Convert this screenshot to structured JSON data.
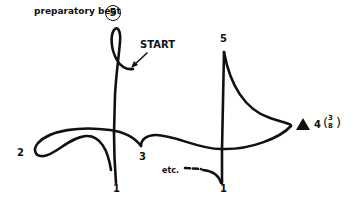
{
  "diagram": {
    "title_label": "preparatory beat",
    "preparatory_beat_number": "5",
    "start_label": "START",
    "beats": [
      {
        "label": "1",
        "position": "downbeat-first"
      },
      {
        "label": "2",
        "position": "left"
      },
      {
        "label": "3",
        "position": "center-right"
      },
      {
        "label": "4",
        "position": "right",
        "suffix": "(3/8)"
      },
      {
        "label": "5",
        "position": "top-right"
      },
      {
        "label": "1",
        "position": "downbeat-repeat"
      }
    ],
    "beat_labels": {
      "one_a": "1",
      "two": "2",
      "three": "3",
      "four": "4",
      "four_frac_num": "3",
      "four_frac_den": "8",
      "five": "5",
      "one_b": "1"
    },
    "continuation_label": "etc.",
    "marker": "filled-triangle",
    "colors": {
      "ink": "#111111",
      "background": "#ffffff"
    }
  }
}
